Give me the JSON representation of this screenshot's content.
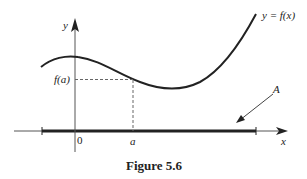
{
  "figure": {
    "caption": "Figure 5.6",
    "labels": {
      "y_axis": "y",
      "x_axis": "x",
      "curve": "y = f(x)",
      "f_of_a": "f(a)",
      "origin": "0",
      "a": "a",
      "arrow_label": "A"
    },
    "colors": {
      "ink": "#222222",
      "axis": "#555555"
    }
  }
}
